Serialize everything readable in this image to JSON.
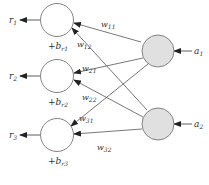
{
  "diagram": {
    "type": "single-layer neural network",
    "colors": {
      "line": "#555555",
      "output_fill": "#ffffff",
      "input_fill": "#e0e0e0",
      "text": "#333333"
    },
    "outputs": [
      {
        "id": "r1",
        "label": "r",
        "sub": "1",
        "bias": "+b",
        "bias_sub": "r1"
      },
      {
        "id": "r2",
        "label": "r",
        "sub": "2",
        "bias": "+b",
        "bias_sub": "r2"
      },
      {
        "id": "r3",
        "label": "r",
        "sub": "3",
        "bias": "+b",
        "bias_sub": "r3"
      }
    ],
    "inputs": [
      {
        "id": "a1",
        "label": "a",
        "sub": "1"
      },
      {
        "id": "a2",
        "label": "a",
        "sub": "2"
      }
    ],
    "weights": [
      {
        "label": "w",
        "sub": "11",
        "from": "a1",
        "to": "r1"
      },
      {
        "label": "w",
        "sub": "12",
        "from": "a2",
        "to": "r1"
      },
      {
        "label": "w",
        "sub": "21",
        "from": "a1",
        "to": "r2"
      },
      {
        "label": "w",
        "sub": "22",
        "from": "a2",
        "to": "r2"
      },
      {
        "label": "w",
        "sub": "31",
        "from": "a1",
        "to": "r3"
      },
      {
        "label": "w",
        "sub": "32",
        "from": "a2",
        "to": "r3"
      }
    ]
  }
}
